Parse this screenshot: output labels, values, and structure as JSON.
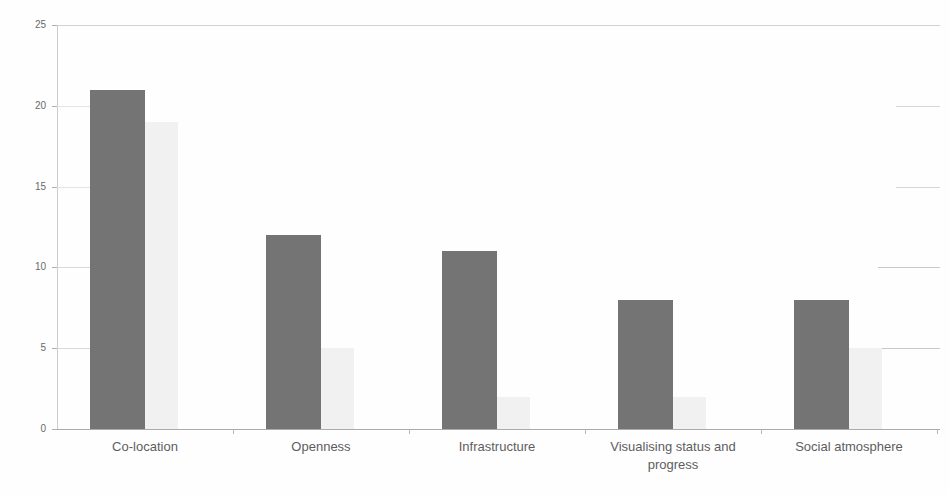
{
  "chart_data": {
    "type": "bar",
    "title": "",
    "subtitle": "",
    "xlabel": "",
    "ylabel": "",
    "ylim": [
      0,
      25
    ],
    "ytick_values": [
      0,
      5,
      10,
      15,
      20,
      25
    ],
    "ytick_labels": [
      "0",
      "5",
      "10",
      "15",
      "20",
      "25"
    ],
    "grid": "horizontal-faded",
    "legend": "none",
    "categories": [
      "Co-location",
      "Openness",
      "Infrastructure",
      "Visualising status and progress",
      "Social atmosphere"
    ],
    "category_label_lines": [
      [
        "Co-location"
      ],
      [
        "Openness"
      ],
      [
        "Infrastructure"
      ],
      [
        "Visualising status and",
        "progress"
      ],
      [
        "Social atmosphere"
      ]
    ],
    "series": [
      {
        "name": "Series 1",
        "color": "#575757",
        "values": [
          21,
          12,
          11,
          8,
          8
        ]
      },
      {
        "name": "Series 2",
        "color": "#f0f0f0",
        "values": [
          19,
          5,
          2,
          2,
          5
        ]
      }
    ]
  },
  "colors": {
    "series_a": "#575757",
    "series_b": "#f0f0f0",
    "axis": "#9a9a9a",
    "grid": "#d2d2d2",
    "tick_text": "#4a4a4a",
    "category_text": "#3a3a3a",
    "background": "#ffffff"
  },
  "geometry": {
    "plot_left": 57,
    "plot_top": 25,
    "plot_width": 883,
    "plot_height": 405,
    "baseline_y": 430,
    "band_width": 176,
    "bar_a_width": 55,
    "bar_b_width": 33,
    "bar_offset_in_band": 33
  }
}
